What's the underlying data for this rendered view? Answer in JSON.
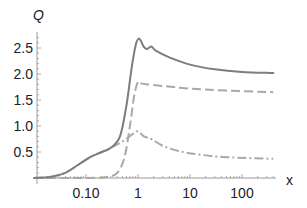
{
  "chart_data": {
    "type": "line",
    "title": "",
    "xlabel": "x",
    "ylabel": "Q",
    "xscale": "log",
    "xlim": [
      0.01,
      400
    ],
    "ylim": [
      0,
      2.8
    ],
    "grid": false,
    "legend": null,
    "x_ticks": [
      {
        "value": 0.1,
        "label": "0.10"
      },
      {
        "value": 1,
        "label": "1"
      },
      {
        "value": 10,
        "label": "10"
      },
      {
        "value": 100,
        "label": "100"
      }
    ],
    "y_ticks": [
      {
        "value": 0.5,
        "label": "0.5"
      },
      {
        "value": 1.0,
        "label": "1.0"
      },
      {
        "value": 1.5,
        "label": "1.5"
      },
      {
        "value": 2.0,
        "label": "2.0"
      },
      {
        "value": 2.5,
        "label": "2.5"
      }
    ],
    "series": [
      {
        "name": "solid",
        "style": "solid",
        "color": "#7d7d7d",
        "points": [
          [
            0.01,
            0.0
          ],
          [
            0.02,
            0.02
          ],
          [
            0.04,
            0.1
          ],
          [
            0.07,
            0.25
          ],
          [
            0.12,
            0.4
          ],
          [
            0.2,
            0.5
          ],
          [
            0.3,
            0.58
          ],
          [
            0.45,
            0.8
          ],
          [
            0.6,
            1.4
          ],
          [
            0.75,
            2.1
          ],
          [
            0.9,
            2.55
          ],
          [
            1.05,
            2.68
          ],
          [
            1.3,
            2.52
          ],
          [
            1.5,
            2.48
          ],
          [
            1.8,
            2.53
          ],
          [
            2.2,
            2.45
          ],
          [
            4,
            2.32
          ],
          [
            10,
            2.18
          ],
          [
            30,
            2.09
          ],
          [
            100,
            2.04
          ],
          [
            400,
            2.02
          ]
        ]
      },
      {
        "name": "dashed",
        "style": "dashed",
        "color": "#a9a9a9",
        "points": [
          [
            0.01,
            0.0
          ],
          [
            0.1,
            0.0
          ],
          [
            0.25,
            0.02
          ],
          [
            0.4,
            0.1
          ],
          [
            0.55,
            0.4
          ],
          [
            0.7,
            1.0
          ],
          [
            0.85,
            1.6
          ],
          [
            1.0,
            1.85
          ],
          [
            1.15,
            1.82
          ],
          [
            1.5,
            1.8
          ],
          [
            3,
            1.77
          ],
          [
            10,
            1.72
          ],
          [
            50,
            1.68
          ],
          [
            400,
            1.65
          ]
        ]
      },
      {
        "name": "dot-dashed",
        "style": "dotdash",
        "color": "#a9a9a9",
        "points": [
          [
            0.01,
            0.0
          ],
          [
            0.02,
            0.02
          ],
          [
            0.04,
            0.1
          ],
          [
            0.07,
            0.25
          ],
          [
            0.12,
            0.4
          ],
          [
            0.2,
            0.5
          ],
          [
            0.3,
            0.58
          ],
          [
            0.5,
            0.7
          ],
          [
            0.8,
            0.85
          ],
          [
            1.0,
            0.9
          ],
          [
            1.3,
            0.8
          ],
          [
            1.8,
            0.75
          ],
          [
            3,
            0.62
          ],
          [
            6,
            0.52
          ],
          [
            15,
            0.45
          ],
          [
            50,
            0.4
          ],
          [
            400,
            0.37
          ]
        ]
      }
    ]
  }
}
